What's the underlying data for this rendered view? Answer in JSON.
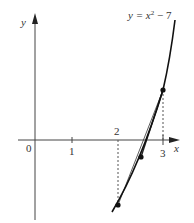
{
  "diagram": {
    "type": "function-graph-secant",
    "equation_label": {
      "y": "y",
      "eq": " = x",
      "sup": "2",
      "rest": " − 7"
    },
    "axes": {
      "x_label": "x",
      "y_label": "y",
      "origin_label": "0"
    },
    "ticks": [
      {
        "value": 1,
        "label": "1"
      },
      {
        "value": 2,
        "label": "2"
      },
      {
        "value": 3,
        "label": "3"
      }
    ],
    "points": [
      {
        "name": "A",
        "x": 2,
        "y": -3
      },
      {
        "name": "B",
        "x": 2.5,
        "y": -0.75
      },
      {
        "name": "C",
        "x": 3,
        "y": 2
      }
    ],
    "secants": [
      {
        "from": "A",
        "to": "C"
      },
      {
        "from": "B",
        "to": "C"
      }
    ],
    "dashed_guides": [
      {
        "x": 2,
        "from_y": 0,
        "to_y": -3
      },
      {
        "x": 3,
        "from_y": 2,
        "to_y": 0
      }
    ],
    "colors": {
      "curve": "#111111",
      "axes": "#333333",
      "dashed": "#555555"
    }
  }
}
